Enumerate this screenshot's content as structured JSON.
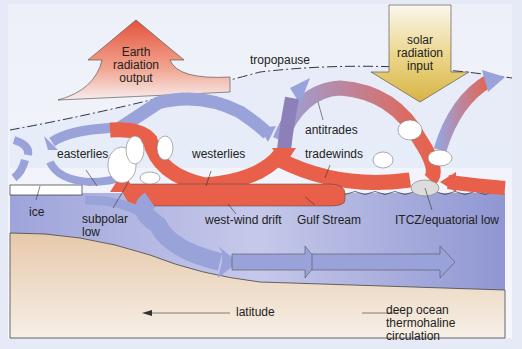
{
  "diagram": {
    "colors": {
      "frame_bg": "#e6e9f6",
      "sky": "#f2f4fb",
      "upper_atmosphere": "#dfe6f4",
      "ocean": "#8f95d2",
      "seafloor": "#ead2b8",
      "warm_arrow": "#e8604a",
      "cool_arrow": "#9aa2da",
      "solar_arrow": "#e0c25a"
    },
    "labels": {
      "earth_radiation": [
        "Earth",
        "radiation",
        "output"
      ],
      "solar_radiation": [
        "solar",
        "radiation",
        "input"
      ],
      "tropopause": "tropopause",
      "easterlies": "easterlies",
      "westerlies": "westerlies",
      "antitrades": "antitrades",
      "tradewinds": "tradewinds",
      "ice": "ice",
      "subpolar_low": [
        "subpolar",
        "low"
      ],
      "west_wind_drift": "west-wind drift",
      "gulf_stream": "Gulf Stream",
      "itcz": "ITCZ/equatorial low",
      "latitude": "latitude",
      "deep_ocean": [
        "deep ocean",
        "thermohaline",
        "circulation"
      ]
    }
  }
}
